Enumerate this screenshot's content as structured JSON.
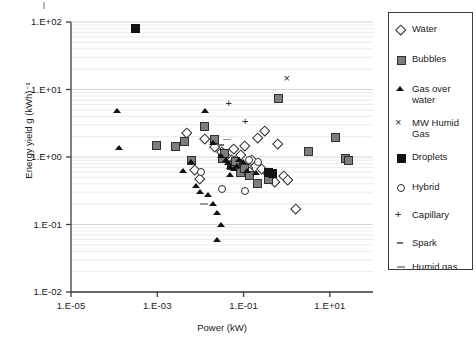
{
  "figure": {
    "background": "#ffffff",
    "plot_border_color": "#3d3d3d",
    "gridline_color": "#d9d9d9"
  },
  "axes": {
    "x_title": "Power (kW)",
    "y_title": "Energy yield g (kWh)⁻¹",
    "x_ticks": [
      "1.E-05",
      "1.E-03",
      "1.E-01",
      "1.E+01"
    ],
    "y_ticks": [
      "1.E+02",
      "1.E+01",
      "1.E+00",
      "1.E-01",
      "1.E-02"
    ]
  },
  "legend": {
    "entries": [
      {
        "label": "Water",
        "marker": "diamond-open"
      },
      {
        "label": "Bubbles",
        "marker": "square-gray"
      },
      {
        "label": "Gas over\nwater",
        "marker": "triangle-filled"
      },
      {
        "label": "MW Humid\nGas",
        "marker": "x-cross"
      },
      {
        "label": "Droplets",
        "marker": "square-black"
      },
      {
        "label": "Hybrid",
        "marker": "circle-open"
      },
      {
        "label": "Capillary",
        "marker": "plus"
      },
      {
        "label": "Spark",
        "marker": "spark-dash"
      },
      {
        "label": "Humid gas",
        "marker": "dash-gray"
      }
    ]
  },
  "chart_data": {
    "type": "scatter",
    "title": "",
    "xlabel": "Power (kW)",
    "ylabel": "Energy yield g (kWh)⁻¹",
    "xscale": "log",
    "yscale": "log",
    "xlim": [
      1e-05,
      100.0
    ],
    "ylim": [
      0.01,
      100.0
    ],
    "grid": "minor-horizontal",
    "legend_position": "right-outside",
    "series": [
      {
        "name": "Water",
        "marker": "diamond-open",
        "points": [
          [
            0.0045,
            2.35
          ],
          [
            0.012,
            1.95
          ],
          [
            0.02,
            1.45
          ],
          [
            0.03,
            1.25
          ],
          [
            0.033,
            1.05
          ],
          [
            0.04,
            1.0
          ],
          [
            0.05,
            0.95
          ],
          [
            0.055,
            1.35
          ],
          [
            0.06,
            0.9
          ],
          [
            0.07,
            0.85
          ],
          [
            0.08,
            1.1
          ],
          [
            0.09,
            0.78
          ],
          [
            0.1,
            1.5
          ],
          [
            0.12,
            0.72
          ],
          [
            0.13,
            0.62
          ],
          [
            0.15,
            0.95
          ],
          [
            0.2,
            2.0
          ],
          [
            0.25,
            0.7
          ],
          [
            0.3,
            2.5
          ],
          [
            0.35,
            0.6
          ],
          [
            0.4,
            0.52
          ],
          [
            0.5,
            0.45
          ],
          [
            0.6,
            1.6
          ],
          [
            0.8,
            0.55
          ],
          [
            1.0,
            0.48
          ],
          [
            1.5,
            0.18
          ],
          [
            0.007,
            0.68
          ],
          [
            0.009,
            0.5
          ]
        ]
      },
      {
        "name": "Bubbles",
        "marker": "square-gray",
        "points": [
          [
            0.0009,
            1.55
          ],
          [
            0.004,
            1.75
          ],
          [
            0.012,
            2.9
          ],
          [
            0.02,
            1.85
          ],
          [
            0.03,
            0.98
          ],
          [
            0.035,
            1.15
          ],
          [
            0.05,
            0.78
          ],
          [
            0.06,
            0.9
          ],
          [
            0.08,
            0.62
          ],
          [
            0.1,
            0.7
          ],
          [
            0.13,
            0.55
          ],
          [
            0.2,
            0.42
          ],
          [
            0.35,
            0.48
          ],
          [
            0.6,
            7.5
          ],
          [
            3.0,
            1.25
          ],
          [
            13.0,
            2.0
          ],
          [
            22.0,
            1.0
          ],
          [
            26.0,
            0.92
          ],
          [
            0.0025,
            1.5
          ],
          [
            0.006,
            0.92
          ]
        ]
      },
      {
        "name": "Gas over water",
        "marker": "triangle-filled",
        "points": [
          [
            0.00012,
            4.8
          ],
          [
            0.00013,
            1.35
          ],
          [
            0.013,
            4.8
          ],
          [
            0.02,
            1.6
          ],
          [
            0.03,
            1.05
          ],
          [
            0.04,
            0.92
          ],
          [
            0.045,
            0.82
          ],
          [
            0.05,
            0.72
          ],
          [
            0.06,
            0.68
          ],
          [
            0.07,
            0.75
          ],
          [
            0.08,
            0.9
          ],
          [
            0.1,
            0.85
          ],
          [
            0.12,
            0.62
          ],
          [
            0.006,
            0.85
          ],
          [
            0.008,
            0.38
          ],
          [
            0.01,
            0.3
          ],
          [
            0.015,
            0.28
          ],
          [
            0.02,
            0.2
          ],
          [
            0.025,
            0.15
          ],
          [
            0.03,
            0.1
          ],
          [
            0.025,
            0.06
          ],
          [
            0.05,
            0.55
          ],
          [
            0.004,
            0.62
          ],
          [
            0.2,
            0.58
          ]
        ]
      },
      {
        "name": "MW Humid Gas",
        "marker": "x-cross",
        "points": [
          [
            1.1,
            14.0
          ]
        ]
      },
      {
        "name": "Droplets",
        "marker": "square-black",
        "points": [
          [
            0.0003,
            82.0
          ],
          [
            0.35,
            0.6
          ],
          [
            0.45,
            0.58
          ]
        ]
      },
      {
        "name": "Hybrid",
        "marker": "circle-open",
        "points": [
          [
            0.01,
            0.62
          ],
          [
            0.03,
            0.35
          ],
          [
            0.1,
            0.32
          ],
          [
            0.13,
            0.95
          ],
          [
            0.2,
            0.88
          ]
        ]
      },
      {
        "name": "Capillary",
        "marker": "plus",
        "points": [
          [
            0.05,
            6.0
          ],
          [
            0.12,
            3.2
          ]
        ]
      },
      {
        "name": "Spark",
        "marker": "spark-dash",
        "points": [
          [
            0.03,
            1.5
          ]
        ]
      },
      {
        "name": "Humid gas",
        "marker": "dash-gray",
        "points": [
          [
            0.012,
            0.2
          ],
          [
            0.04,
            1.8
          ]
        ]
      }
    ]
  }
}
